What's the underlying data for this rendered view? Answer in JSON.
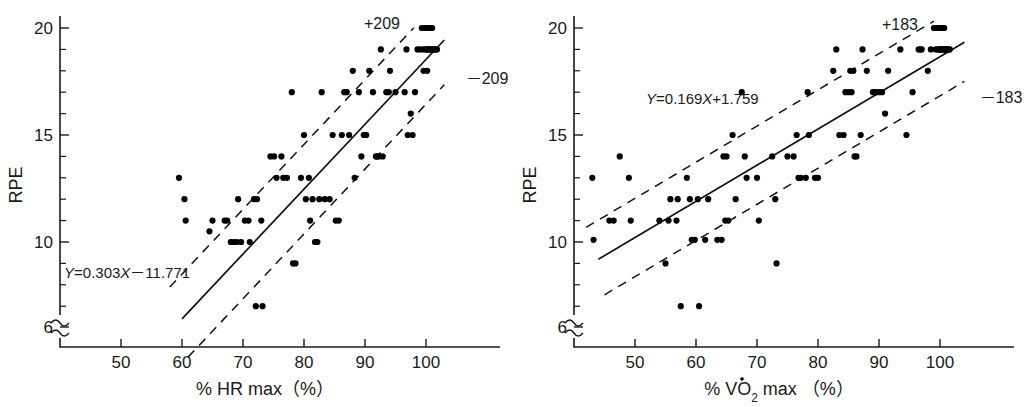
{
  "figure": {
    "panels": [
      {
        "id": "hr-max",
        "y_axis": {
          "label": "RPE",
          "ticks": [
            20,
            15,
            10,
            6
          ],
          "tick_labels": [
            "20",
            "15",
            "10",
            "6"
          ],
          "has_axis_break": true
        },
        "x_axis": {
          "label": "% HR max（%）",
          "label_plain": "% HR max (%)",
          "ticks": [
            50,
            60,
            70,
            80,
            90,
            100
          ],
          "tick_labels": [
            "50",
            "60",
            "70",
            "80",
            "90",
            "100"
          ]
        },
        "equation": "Y=0.303X－11.771",
        "upper_band_label": "+209",
        "lower_band_label": "－209"
      },
      {
        "id": "vo2-max",
        "y_axis": {
          "label": "RPE",
          "ticks": [
            20,
            15,
            10,
            6
          ],
          "tick_labels": [
            "20",
            "15",
            "10",
            "6"
          ],
          "has_axis_break": true
        },
        "x_axis": {
          "label": "% V̇O₂ max（%）",
          "label_parts": {
            "percent": "%",
            "v_dot": "V",
            "o": "O",
            "subscript": "2",
            "max": "max",
            "paren": "（%）"
          },
          "ticks": [
            50,
            60,
            70,
            80,
            90,
            100
          ],
          "tick_labels": [
            "50",
            "60",
            "70",
            "80",
            "90",
            "100"
          ]
        },
        "equation": "Y=0.169X+1.759",
        "upper_band_label": "+183",
        "lower_band_label": "－183"
      }
    ]
  },
  "chart_data": [
    {
      "type": "scatter",
      "title": "",
      "xlabel": "% HR max (%)",
      "ylabel": "RPE",
      "xlim": [
        42,
        106
      ],
      "ylim": [
        6,
        20.6
      ],
      "grid": false,
      "legend": "none",
      "regression": {
        "equation": "Y = 0.303X - 11.771",
        "slope": 0.303,
        "intercept": -11.771,
        "x_start": 60,
        "x_end": 103
      },
      "confidence_bands": [
        {
          "name": "+209",
          "offset": 2.09,
          "label": "+209"
        },
        {
          "name": "-209",
          "offset": -2.09,
          "label": "-209"
        }
      ],
      "points": [
        [
          59.5,
          13
        ],
        [
          60.4,
          12
        ],
        [
          60.6,
          11
        ],
        [
          64.5,
          10.5
        ],
        [
          65,
          11
        ],
        [
          67,
          11
        ],
        [
          67.4,
          11
        ],
        [
          68,
          10
        ],
        [
          68.5,
          10
        ],
        [
          69,
          10
        ],
        [
          69.2,
          12
        ],
        [
          69.7,
          10
        ],
        [
          70.3,
          11
        ],
        [
          70.9,
          11
        ],
        [
          71.1,
          10
        ],
        [
          71.8,
          12
        ],
        [
          72.3,
          12
        ],
        [
          72.1,
          7
        ],
        [
          73.2,
          7
        ],
        [
          73,
          11
        ],
        [
          74.5,
          14
        ],
        [
          75.1,
          14
        ],
        [
          75.5,
          13
        ],
        [
          76.3,
          14
        ],
        [
          76.6,
          13
        ],
        [
          77.2,
          13
        ],
        [
          78,
          17
        ],
        [
          78.2,
          9
        ],
        [
          78.6,
          9
        ],
        [
          79.5,
          13
        ],
        [
          80,
          15
        ],
        [
          80.3,
          12
        ],
        [
          80.8,
          13
        ],
        [
          81,
          11
        ],
        [
          81.4,
          12
        ],
        [
          81.8,
          10
        ],
        [
          82.2,
          10
        ],
        [
          82.5,
          12
        ],
        [
          82.9,
          17
        ],
        [
          83.4,
          12
        ],
        [
          84.2,
          12
        ],
        [
          84.7,
          15
        ],
        [
          85.2,
          11
        ],
        [
          85.7,
          11
        ],
        [
          86.2,
          15
        ],
        [
          86.6,
          17
        ],
        [
          87,
          17
        ],
        [
          87.4,
          15
        ],
        [
          88,
          18
        ],
        [
          88.3,
          13
        ],
        [
          89,
          17
        ],
        [
          89.4,
          14
        ],
        [
          89.8,
          15
        ],
        [
          90.2,
          15
        ],
        [
          90.7,
          18
        ],
        [
          91.3,
          17
        ],
        [
          91.8,
          14
        ],
        [
          92,
          14
        ],
        [
          92.3,
          14
        ],
        [
          92.6,
          19
        ],
        [
          92.9,
          14
        ],
        [
          93.5,
          17
        ],
        [
          93.9,
          17
        ],
        [
          94.1,
          18
        ],
        [
          95,
          17
        ],
        [
          96.5,
          17
        ],
        [
          96.8,
          19
        ],
        [
          97,
          15
        ],
        [
          97.5,
          16
        ],
        [
          97.8,
          15
        ],
        [
          98.2,
          17
        ],
        [
          98.6,
          19
        ],
        [
          99,
          19
        ],
        [
          99.3,
          20
        ],
        [
          99.5,
          19
        ],
        [
          99.7,
          20
        ],
        [
          99.9,
          19
        ],
        [
          100,
          20
        ],
        [
          100.1,
          19
        ],
        [
          100.2,
          20
        ],
        [
          100.3,
          19
        ],
        [
          100.4,
          20
        ],
        [
          100.5,
          19
        ],
        [
          100.6,
          19
        ],
        [
          100.7,
          20
        ],
        [
          100.8,
          19
        ],
        [
          100.9,
          19
        ],
        [
          101,
          20
        ],
        [
          101.1,
          19
        ],
        [
          101.2,
          19
        ],
        [
          101.4,
          19
        ],
        [
          101.6,
          19
        ],
        [
          101.8,
          19
        ],
        [
          99.6,
          18
        ],
        [
          100.2,
          18
        ]
      ]
    },
    {
      "type": "scatter",
      "title": "",
      "xlabel": "% VO2 max (%)",
      "ylabel": "RPE",
      "xlim": [
        42,
        106
      ],
      "ylim": [
        6,
        20.6
      ],
      "grid": false,
      "legend": "none",
      "regression": {
        "equation": "Y = 0.169X + 1.759",
        "slope": 0.169,
        "intercept": 1.759,
        "x_start": 44,
        "x_end": 104
      },
      "confidence_bands": [
        {
          "name": "+183",
          "offset": 1.83,
          "label": "+183"
        },
        {
          "name": "-183",
          "offset": -1.83,
          "label": "-183"
        }
      ],
      "points": [
        [
          43,
          13
        ],
        [
          43.2,
          10.1
        ],
        [
          45.8,
          11
        ],
        [
          46.5,
          11
        ],
        [
          47.5,
          14
        ],
        [
          49,
          13
        ],
        [
          49.3,
          11
        ],
        [
          54,
          11
        ],
        [
          55,
          9
        ],
        [
          55.5,
          11
        ],
        [
          55.8,
          12
        ],
        [
          56.8,
          11
        ],
        [
          57,
          12
        ],
        [
          57.5,
          7
        ],
        [
          58.5,
          13
        ],
        [
          59,
          12
        ],
        [
          59.3,
          10.1
        ],
        [
          59.8,
          10.1
        ],
        [
          60.3,
          12
        ],
        [
          60.5,
          7
        ],
        [
          61.5,
          10.1
        ],
        [
          62,
          12
        ],
        [
          63.5,
          10.1
        ],
        [
          64.2,
          10.1
        ],
        [
          64.5,
          14
        ],
        [
          64.8,
          11
        ],
        [
          65,
          14
        ],
        [
          65.3,
          11
        ],
        [
          66,
          15
        ],
        [
          66.5,
          12
        ],
        [
          67.5,
          17
        ],
        [
          68,
          14
        ],
        [
          68.3,
          13
        ],
        [
          70,
          13
        ],
        [
          70.3,
          11
        ],
        [
          72.5,
          14
        ],
        [
          73,
          12
        ],
        [
          73.2,
          9
        ],
        [
          75,
          14
        ],
        [
          76,
          14
        ],
        [
          76.5,
          15
        ],
        [
          76.8,
          13
        ],
        [
          77.2,
          13
        ],
        [
          78,
          13
        ],
        [
          78.3,
          17
        ],
        [
          78.5,
          15
        ],
        [
          79.5,
          13
        ],
        [
          80,
          13
        ],
        [
          82.5,
          18
        ],
        [
          83,
          19
        ],
        [
          83.5,
          15
        ],
        [
          84.2,
          15
        ],
        [
          84.5,
          17
        ],
        [
          85,
          17
        ],
        [
          85.3,
          18
        ],
        [
          85.5,
          17
        ],
        [
          85.8,
          18
        ],
        [
          86,
          14
        ],
        [
          86.3,
          14
        ],
        [
          87,
          15
        ],
        [
          87.3,
          19
        ],
        [
          88,
          18
        ],
        [
          89,
          17
        ],
        [
          89.3,
          17
        ],
        [
          89.5,
          17
        ],
        [
          90,
          17
        ],
        [
          90.5,
          17
        ],
        [
          91,
          16
        ],
        [
          91.5,
          18
        ],
        [
          93.5,
          19
        ],
        [
          94.5,
          15
        ],
        [
          95.5,
          17
        ],
        [
          96.5,
          19
        ],
        [
          96.8,
          19
        ],
        [
          97,
          19
        ],
        [
          98,
          18
        ],
        [
          98.5,
          19
        ],
        [
          99,
          20
        ],
        [
          99.3,
          19
        ],
        [
          99.5,
          20
        ],
        [
          99.7,
          19
        ],
        [
          99.9,
          20
        ],
        [
          100,
          19
        ],
        [
          100.2,
          20
        ],
        [
          100.3,
          19
        ],
        [
          100.4,
          20
        ],
        [
          100.5,
          19
        ],
        [
          100.6,
          19
        ],
        [
          100.7,
          20
        ],
        [
          100.8,
          19
        ],
        [
          100.9,
          19
        ],
        [
          101,
          19
        ],
        [
          101.2,
          19
        ],
        [
          101.4,
          19
        ],
        [
          101.6,
          19
        ],
        [
          99.8,
          19
        ],
        [
          100.1,
          19
        ]
      ]
    }
  ]
}
